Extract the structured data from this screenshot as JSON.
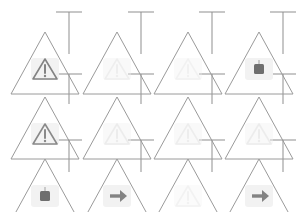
{
  "canvas": {
    "width": 296,
    "height": 212,
    "background": "#ffffff",
    "title": "Warning Sign Icon Grid"
  },
  "palette": {
    "sign_outline": "#9a9a9a",
    "tick_line": "#8f8f8f",
    "icon_light": "#d6d6d6",
    "icon_medium": "#bdbdbd",
    "icon_dark": "#7d7d7d",
    "icon_darkest": "#6e6e6e",
    "icon_fill_pale": "#f2f2f2"
  },
  "grid": {
    "columns": 4,
    "rows": 3,
    "cell_width": 74,
    "cell_height": 71
  },
  "ticks": [
    {
      "name": "tick-r0-c0",
      "x": 69,
      "y": 12,
      "arm": 26,
      "stem": 42,
      "orientation": "t-down"
    },
    {
      "name": "tick-r0-c1",
      "x": 141,
      "y": 12,
      "arm": 26,
      "stem": 42,
      "orientation": "t-down"
    },
    {
      "name": "tick-r0-c2",
      "x": 212,
      "y": 12,
      "arm": 26,
      "stem": 42,
      "orientation": "t-down"
    },
    {
      "name": "tick-r0-c3",
      "x": 283,
      "y": 12,
      "arm": 26,
      "stem": 42,
      "orientation": "t-down"
    },
    {
      "name": "tick-r1-c0",
      "x": 69,
      "y": 74,
      "arm": 26,
      "stem": 30,
      "orientation": "t-down"
    },
    {
      "name": "tick-r1-c1",
      "x": 141,
      "y": 74,
      "arm": 26,
      "stem": 30,
      "orientation": "t-down"
    },
    {
      "name": "tick-r1-c2",
      "x": 212,
      "y": 74,
      "arm": 26,
      "stem": 30,
      "orientation": "t-down"
    },
    {
      "name": "tick-r1-c3",
      "x": 283,
      "y": 74,
      "arm": 26,
      "stem": 30,
      "orientation": "t-down"
    },
    {
      "name": "tick-r2-c0",
      "x": 69,
      "y": 140,
      "arm": 26,
      "stem": 32,
      "orientation": "t-down"
    },
    {
      "name": "tick-r2-c1",
      "x": 141,
      "y": 140,
      "arm": 26,
      "stem": 32,
      "orientation": "t-down"
    },
    {
      "name": "tick-r2-c2",
      "x": 212,
      "y": 140,
      "arm": 26,
      "stem": 32,
      "orientation": "t-down"
    },
    {
      "name": "tick-r2-c3",
      "x": 283,
      "y": 140,
      "arm": 26,
      "stem": 32,
      "orientation": "t-down"
    }
  ],
  "cells": [
    {
      "id": "cell-r1-c1",
      "row": 1,
      "col": 1,
      "x": 8,
      "y": 28,
      "sign": "warning-triangle-outline",
      "icon": "warning-triangle-icon",
      "icon_shade": "dark",
      "icon_opacity": 0.95,
      "label": "warning sign 1"
    },
    {
      "id": "cell-r1-c2",
      "row": 1,
      "col": 2,
      "x": 80,
      "y": 28,
      "sign": "warning-triangle-outline",
      "icon": "warning-triangle-icon",
      "icon_shade": "light",
      "icon_opacity": 0.4,
      "label": "warning sign 2"
    },
    {
      "id": "cell-r1-c3",
      "row": 1,
      "col": 3,
      "x": 151,
      "y": 28,
      "sign": "warning-triangle-outline",
      "icon": "warning-triangle-icon",
      "icon_shade": "light",
      "icon_opacity": 0.32,
      "label": "warning sign 3"
    },
    {
      "id": "cell-r1-c4",
      "row": 1,
      "col": 4,
      "x": 222,
      "y": 28,
      "sign": "warning-triangle-outline",
      "icon": "stop-square-icon",
      "icon_shade": "darkest",
      "icon_opacity": 1.0,
      "label": "stop sign 4"
    },
    {
      "id": "cell-r2-c1",
      "row": 2,
      "col": 1,
      "x": 8,
      "y": 93,
      "sign": "warning-triangle-outline",
      "icon": "warning-triangle-icon",
      "icon_shade": "dark",
      "icon_opacity": 0.9,
      "label": "warning sign 5"
    },
    {
      "id": "cell-r2-c2",
      "row": 2,
      "col": 2,
      "x": 80,
      "y": 93,
      "sign": "warning-triangle-outline",
      "icon": "warning-triangle-icon",
      "icon_shade": "light",
      "icon_opacity": 0.45,
      "label": "warning sign 6"
    },
    {
      "id": "cell-r2-c3",
      "row": 2,
      "col": 3,
      "x": 151,
      "y": 93,
      "sign": "warning-triangle-outline",
      "icon": "warning-triangle-icon",
      "icon_shade": "light",
      "icon_opacity": 0.42,
      "label": "warning sign 7"
    },
    {
      "id": "cell-r2-c4",
      "row": 2,
      "col": 4,
      "x": 222,
      "y": 93,
      "sign": "warning-triangle-outline",
      "icon": "warning-triangle-icon",
      "icon_shade": "light",
      "icon_opacity": 0.45,
      "label": "warning sign 8"
    },
    {
      "id": "cell-r3-c1",
      "row": 3,
      "col": 1,
      "x": 8,
      "y": 155,
      "sign": "warning-triangle-outline",
      "icon": "stop-square-icon",
      "icon_shade": "darkest",
      "icon_opacity": 1.0,
      "label": "stop sign 9"
    },
    {
      "id": "cell-r3-c2",
      "row": 3,
      "col": 2,
      "x": 80,
      "y": 155,
      "sign": "warning-triangle-outline",
      "icon": "arrow-right-icon",
      "icon_shade": "dark",
      "icon_opacity": 0.95,
      "label": "arrow sign 10"
    },
    {
      "id": "cell-r3-c3",
      "row": 3,
      "col": 3,
      "x": 151,
      "y": 155,
      "sign": "warning-triangle-outline",
      "icon": "warning-triangle-icon",
      "icon_shade": "light",
      "icon_opacity": 0.3,
      "label": "warning sign 11"
    },
    {
      "id": "cell-r3-c4",
      "row": 3,
      "col": 4,
      "x": 222,
      "y": 155,
      "sign": "warning-triangle-outline",
      "icon": "arrow-right-icon",
      "icon_shade": "dark",
      "icon_opacity": 0.95,
      "label": "arrow sign 12"
    }
  ]
}
